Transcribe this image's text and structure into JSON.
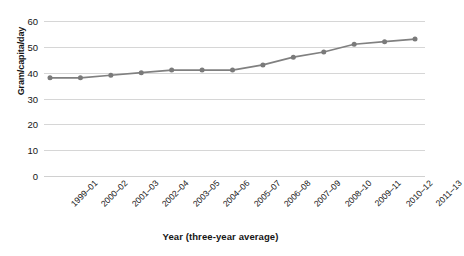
{
  "chart_data": {
    "type": "line",
    "title": "",
    "subtitle": "",
    "xlabel": "Year (three-year average)",
    "ylabel": "Gram/capita/day",
    "categories": [
      "1999–01",
      "2000–02",
      "2001–03",
      "2002–04",
      "2003–05",
      "2004–06",
      "2005–07",
      "2006–08",
      "2007–09",
      "2008–10",
      "2009–11",
      "2010–12",
      "2011–13"
    ],
    "values": [
      38,
      38,
      39,
      40,
      41,
      41,
      41,
      43,
      46,
      48,
      51,
      52,
      53
    ],
    "series": [
      {
        "name": "Gram/capita/day",
        "values": [
          38,
          38,
          39,
          40,
          41,
          41,
          41,
          43,
          46,
          48,
          51,
          52,
          53
        ]
      }
    ],
    "ylim": [
      0,
      60
    ],
    "yticks": [
      0,
      10,
      20,
      30,
      40,
      50,
      60
    ],
    "ytick_labels": [
      "0",
      "10",
      "20",
      "30",
      "40",
      "50",
      "60"
    ],
    "grid": "horizontal",
    "legend": "none",
    "marker": "circle",
    "colors": {
      "line": "#808080",
      "marker": "#7a7a7a",
      "gridline": "#d6d6d6",
      "text": "#151515",
      "background": "#ffffff"
    },
    "xtick_rotation": "-45"
  }
}
